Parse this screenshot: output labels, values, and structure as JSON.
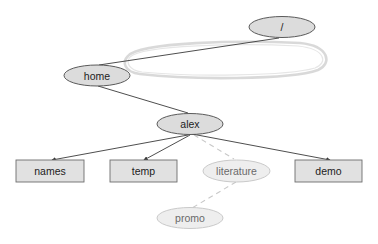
{
  "diagram": {
    "type": "directory-tree",
    "nodes": [
      {
        "id": "root",
        "label": "/",
        "shape": "ellipse",
        "style": "dark"
      },
      {
        "id": "home",
        "label": "home",
        "shape": "ellipse",
        "style": "dark"
      },
      {
        "id": "alex",
        "label": "alex",
        "shape": "ellipse",
        "style": "dark"
      },
      {
        "id": "names",
        "label": "names",
        "shape": "box",
        "style": "dark"
      },
      {
        "id": "temp",
        "label": "temp",
        "shape": "box",
        "style": "dark"
      },
      {
        "id": "literature",
        "label": "literature",
        "shape": "ellipse",
        "style": "faded"
      },
      {
        "id": "demo",
        "label": "demo",
        "shape": "box",
        "style": "dark"
      },
      {
        "id": "promo",
        "label": "promo",
        "shape": "ellipse",
        "style": "faded"
      }
    ],
    "edges": [
      {
        "from": "root",
        "to": "home",
        "style": "solid"
      },
      {
        "from": "home",
        "to": "alex",
        "style": "solid"
      },
      {
        "from": "alex",
        "to": "names",
        "style": "solid-arrow"
      },
      {
        "from": "alex",
        "to": "temp",
        "style": "solid-arrow"
      },
      {
        "from": "alex",
        "to": "literature",
        "style": "dashed"
      },
      {
        "from": "alex",
        "to": "demo",
        "style": "solid-arrow"
      },
      {
        "from": "literature",
        "to": "promo",
        "style": "dashed"
      }
    ],
    "annotations": [
      {
        "type": "loop-highlight",
        "around_edge": "root-home",
        "color": "#cfcfcf"
      }
    ],
    "colors": {
      "node_fill": "#dcdcdc",
      "node_stroke": "#4a4a4a",
      "faded_fill": "#eeeeee",
      "faded_stroke": "#c4c4c4",
      "edge": "#3a3a3a",
      "dashed_edge": "#c8c8c8"
    }
  }
}
